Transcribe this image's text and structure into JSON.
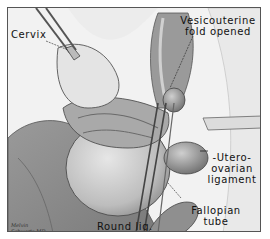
{
  "illustration": {
    "subject": "surgical view of uterus with vesicouterine fold opened",
    "labels": {
      "cervix": "Cervix",
      "vesicouterine_line1": "Vesicouterine",
      "vesicouterine_line2": "fold opened",
      "uteroovarian_line1": "-Utero-",
      "uteroovarian_line2": "ovarian",
      "uteroovarian_line3": "ligament",
      "round_lig": "Round lig.",
      "fallopian_line1": "Fallopian",
      "fallopian_line2": "tube"
    },
    "signature_line1": "Melvin",
    "signature_line2": "Schwartz MD"
  }
}
